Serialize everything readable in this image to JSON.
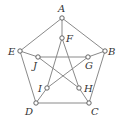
{
  "diagram": {
    "type": "graph",
    "name": "Petersen graph",
    "colors": {
      "edge": "#8a8a8a",
      "node_stroke": "#555555",
      "node_fill": "#ffffff",
      "label": "#333333"
    },
    "nodes": [
      {
        "id": "A",
        "label": "A",
        "x": 62,
        "y": 18,
        "lx": 58,
        "ly": 12
      },
      {
        "id": "B",
        "label": "B",
        "x": 105,
        "y": 51,
        "lx": 108,
        "ly": 55
      },
      {
        "id": "C",
        "label": "C",
        "x": 89,
        "y": 103,
        "lx": 91,
        "ly": 115
      },
      {
        "id": "D",
        "label": "D",
        "x": 36,
        "y": 103,
        "lx": 25,
        "ly": 115
      },
      {
        "id": "E",
        "label": "E",
        "x": 20,
        "y": 51,
        "lx": 8,
        "ly": 55
      },
      {
        "id": "F",
        "label": "F",
        "x": 62,
        "y": 38,
        "lx": 66,
        "ly": 42
      },
      {
        "id": "G",
        "label": "G",
        "x": 88,
        "y": 57,
        "lx": 85,
        "ly": 69
      },
      {
        "id": "H",
        "label": "H",
        "x": 79,
        "y": 88,
        "lx": 84,
        "ly": 92
      },
      {
        "id": "I",
        "label": "I",
        "x": 47,
        "y": 88,
        "lx": 38,
        "ly": 92
      },
      {
        "id": "J",
        "label": "J",
        "x": 38,
        "y": 57,
        "lx": 33,
        "ly": 69
      }
    ],
    "edges": [
      [
        "A",
        "B"
      ],
      [
        "B",
        "C"
      ],
      [
        "C",
        "D"
      ],
      [
        "D",
        "E"
      ],
      [
        "E",
        "A"
      ],
      [
        "A",
        "F"
      ],
      [
        "B",
        "G"
      ],
      [
        "C",
        "H"
      ],
      [
        "D",
        "I"
      ],
      [
        "E",
        "J"
      ],
      [
        "F",
        "H"
      ],
      [
        "H",
        "J"
      ],
      [
        "J",
        "G"
      ],
      [
        "G",
        "I"
      ],
      [
        "I",
        "F"
      ]
    ]
  }
}
